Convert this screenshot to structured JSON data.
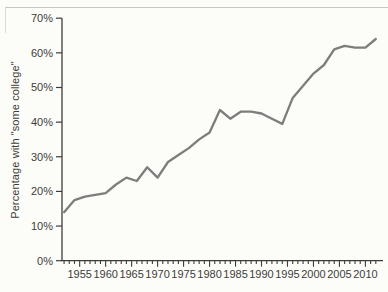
{
  "figure": {
    "line_color": "#7d7d7d",
    "axis_color": "#3c3c3c",
    "text_color": "#3c3c3c",
    "background": "#fcfcf8"
  },
  "chart_data": {
    "type": "line",
    "title": "",
    "xlabel": "",
    "ylabel": "Percentage with \"some college\"",
    "x": [
      1952,
      1954,
      1956,
      1958,
      1960,
      1962,
      1964,
      1966,
      1968,
      1970,
      1972,
      1974,
      1976,
      1978,
      1980,
      1982,
      1984,
      1986,
      1988,
      1990,
      1992,
      1994,
      1996,
      1998,
      2000,
      2002,
      2004,
      2006,
      2008,
      2010,
      2012
    ],
    "series": [
      {
        "name": "Percentage with \"some college\"",
        "values": [
          14,
          17.5,
          18.5,
          19,
          19.5,
          22,
          24,
          23,
          27,
          24,
          28.5,
          30.5,
          32.5,
          35,
          37,
          43.5,
          41,
          43,
          43,
          42.5,
          41,
          39.5,
          47,
          50.5,
          54,
          56.5,
          61,
          62,
          61.5,
          61.5,
          64
        ]
      }
    ],
    "xlim": [
      1951.6,
      2013.0
    ],
    "ylim": [
      0,
      70
    ],
    "y_ticks": [
      0,
      10,
      20,
      30,
      40,
      50,
      60,
      70
    ],
    "y_tick_labels": [
      "0%",
      "10%",
      "20%",
      "30%",
      "40%",
      "50%",
      "60%",
      "70%"
    ],
    "x_major_ticks": [
      1955,
      1960,
      1965,
      1970,
      1975,
      1980,
      1985,
      1990,
      1995,
      2000,
      2005,
      2010
    ],
    "x_major_tick_labels": [
      "1955",
      "1960",
      "1965",
      "1970",
      "1975",
      "1980",
      "1985",
      "1990",
      "1995",
      "2000",
      "2005",
      "2010"
    ],
    "x_tick_years": {
      "start": 1952,
      "end": 2012,
      "step": 1
    },
    "grid": false,
    "legend": "none"
  }
}
